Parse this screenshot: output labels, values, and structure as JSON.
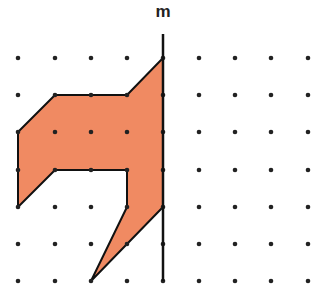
{
  "diagram": {
    "type": "reflection-grid",
    "line_label": "m",
    "grid": {
      "columns": 9,
      "rows": 7,
      "x_coords": [
        18,
        55,
        91,
        127,
        163,
        199,
        235,
        271,
        308
      ],
      "y_coords": [
        58,
        95,
        132,
        170,
        207,
        244,
        281
      ],
      "dot_color": "#222222"
    },
    "mirror_line": {
      "column": 4,
      "top_y": 34,
      "bottom_y": 281,
      "color": "#111111"
    },
    "shape": {
      "fill": "#F08A62",
      "stroke": "#111111",
      "vertices_grid": [
        [
          4,
          0
        ],
        [
          3,
          1
        ],
        [
          1,
          1
        ],
        [
          0,
          2
        ],
        [
          0,
          4
        ],
        [
          1,
          3
        ],
        [
          3,
          3
        ],
        [
          3,
          4
        ],
        [
          2,
          6
        ],
        [
          4,
          4
        ]
      ]
    }
  }
}
